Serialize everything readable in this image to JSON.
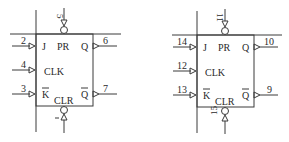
{
  "diagram": {
    "type": "logic-schematic",
    "flipflops": [
      {
        "id": "ff1",
        "labels": {
          "j": "J",
          "clk": "CLK",
          "k": "K",
          "pr": "PR",
          "clr": "CLR",
          "q": "Q",
          "qbar": "Q"
        },
        "pins": {
          "j": "2",
          "clk": "4",
          "k": "3",
          "q": "6",
          "qbar": "7",
          "pr": "5",
          "clr": "1"
        }
      },
      {
        "id": "ff2",
        "labels": {
          "j": "J",
          "clk": "CLK",
          "k": "K",
          "pr": "PR",
          "clr": "CLR",
          "q": "Q",
          "qbar": "Q"
        },
        "pins": {
          "j": "14",
          "clk": "12",
          "k": "13",
          "q": "10",
          "qbar": "9",
          "pr": "11",
          "clr": "15"
        }
      }
    ],
    "colors": {
      "line": "#3a3a3a",
      "text": "#2a2a2a",
      "background": "#ffffff"
    }
  }
}
